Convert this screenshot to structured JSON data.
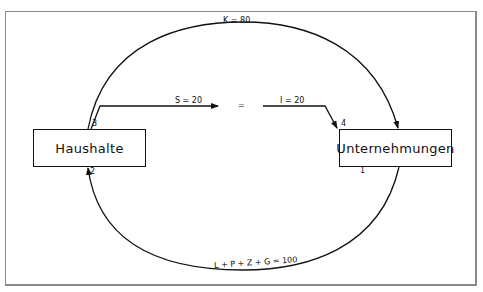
{
  "diagram": {
    "nodes": [
      {
        "id": "haushalte",
        "label": "Haushalte"
      },
      {
        "id": "unternehmungen",
        "label": "Unternehmungen"
      }
    ],
    "flows": {
      "consumption": {
        "label": "K = 80",
        "from": "haushalte",
        "to": "unternehmungen"
      },
      "income": {
        "label": "L + P + Z + G = 100",
        "from": "unternehmungen",
        "to": "haushalte"
      },
      "savings": {
        "label": "S = 20"
      },
      "investment": {
        "label": "I = 20"
      },
      "equals": "="
    },
    "markers": {
      "one": "1",
      "two": "2",
      "three": "3",
      "four": "4"
    }
  }
}
